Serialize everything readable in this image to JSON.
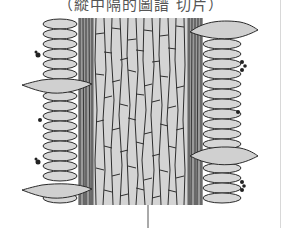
{
  "title": "（縱中隔的圖譜 切片）",
  "diagram": {
    "type": "botanical-tissue-section",
    "colors": {
      "cell_fill": "#d2d2d2",
      "outline": "#2a2a2a",
      "background": "#ffffff",
      "pointer": "#555555"
    },
    "regions": [
      {
        "name": "central-elongated-cells",
        "x": [
          92,
          188
        ]
      },
      {
        "name": "left-dense-band",
        "x": [
          76,
          94
        ]
      },
      {
        "name": "right-dense-band",
        "x": [
          186,
          204
        ]
      },
      {
        "name": "left-epidermal-cells",
        "x": [
          42,
          78
        ]
      },
      {
        "name": "right-epidermal-cells",
        "x": [
          202,
          250
        ]
      }
    ],
    "protrusions": [
      {
        "side": "right",
        "y": 30
      },
      {
        "side": "left",
        "y": 82
      },
      {
        "side": "right",
        "y": 155
      },
      {
        "side": "left",
        "y": 189
      }
    ],
    "pointer_line": {
      "x": 148,
      "y1": 205,
      "y2": 228
    }
  }
}
